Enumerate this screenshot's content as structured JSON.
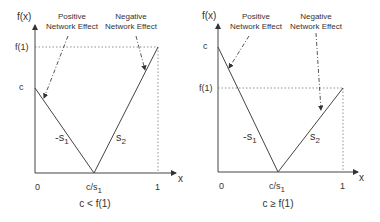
{
  "panels": [
    {
      "id": "left",
      "caption": "c < f(1)",
      "y_axis_label": "f(x)",
      "x_axis_label": "x",
      "y_ticks": {
        "upper": "f(1)",
        "lower": "c"
      },
      "x_ticks": {
        "origin": "0",
        "min_point": "c/s",
        "min_point_sub": "1",
        "end": "1"
      },
      "slopes": {
        "left": "-s",
        "left_sub": "1",
        "right": "s",
        "right_sub": "2"
      },
      "annotations": {
        "positive": [
          "Positive",
          "Network Effect"
        ],
        "negative": [
          "Negative",
          "Network Effect"
        ]
      }
    },
    {
      "id": "right",
      "caption": "c ≥ f(1)",
      "y_axis_label": "f(x)",
      "x_axis_label": "x",
      "y_ticks": {
        "upper": "c",
        "lower": "f(1)"
      },
      "x_ticks": {
        "origin": "0",
        "min_point": "c/s",
        "min_point_sub": "1",
        "end": "1"
      },
      "slopes": {
        "left": "-s",
        "left_sub": "1",
        "right": "s",
        "right_sub": "2"
      },
      "annotations": {
        "positive": [
          "Positive",
          "Network Effect"
        ],
        "negative": [
          "Negative",
          "Network Effect"
        ]
      }
    }
  ],
  "colors": {
    "line": "#444444",
    "dotted": "#777777",
    "text": "#333333"
  }
}
